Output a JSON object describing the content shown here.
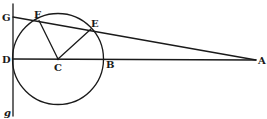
{
  "diagram": {
    "type": "geometry",
    "points": {
      "G": {
        "label": "G",
        "x": 13,
        "y": 17
      },
      "F": {
        "label": "F",
        "x": 39,
        "y": 20
      },
      "E": {
        "label": "E",
        "x": 91,
        "y": 30
      },
      "D": {
        "label": "D",
        "x": 13,
        "y": 59
      },
      "C": {
        "label": "C",
        "x": 58,
        "y": 59
      },
      "B": {
        "label": "B",
        "x": 104,
        "y": 59
      },
      "A": {
        "label": "A",
        "x": 256,
        "y": 60
      },
      "g": {
        "label": "g",
        "x": 13,
        "y": 116
      }
    },
    "circle": {
      "center": "C",
      "radius": 46
    },
    "segments": [
      [
        "G",
        "A"
      ],
      [
        "D",
        "A"
      ],
      [
        "C",
        "F"
      ],
      [
        "C",
        "E"
      ],
      [
        "G",
        "g"
      ]
    ],
    "labels": {
      "G": "G",
      "F": "F",
      "E": "E",
      "D": "D",
      "C": "C",
      "B": "B",
      "A": "A",
      "g": "g"
    }
  }
}
